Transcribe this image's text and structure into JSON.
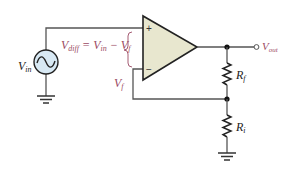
{
  "diagram": {
    "type": "non-inverting op-amp circuit",
    "colors": {
      "wire": "#555555",
      "opamp_fill": "#e8e7cf",
      "source_fill": "#d8e9f4",
      "label_accent": "#9b4a63",
      "label_dark": "#222222"
    },
    "opamp": {
      "plus_sign": "+",
      "minus_sign": "−"
    },
    "labels": {
      "vin_main": "V",
      "vin_sub": "in",
      "vdiff_main": "V",
      "vdiff_sub": "diff",
      "eq_sign": " = ",
      "eq_vin_main": "V",
      "eq_vin_sub": "in",
      "eq_minus": " − ",
      "eq_vf_main": "V",
      "eq_vf_sub": "f",
      "vf_main": "V",
      "vf_sub": "f",
      "vout_main": "V",
      "vout_sub": "out",
      "rf_main": "R",
      "rf_sub": "f",
      "ri_main": "R",
      "ri_sub": "i"
    },
    "components": [
      {
        "name": "AC voltage source",
        "label": "Vin"
      },
      {
        "name": "Op-amp",
        "inputs": [
          "+",
          "−"
        ]
      },
      {
        "name": "Feedback resistor",
        "label": "Rf"
      },
      {
        "name": "Input resistor",
        "label": "Ri"
      },
      {
        "name": "Output terminal",
        "label": "Vout"
      }
    ]
  }
}
